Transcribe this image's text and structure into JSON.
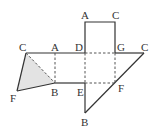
{
  "diagram": {
    "colors": {
      "line": "#333333",
      "dashed": "#555555",
      "shade": "#e3e3e3"
    },
    "labels": {
      "top_a": "A",
      "top_c": "C",
      "left_c": "C",
      "mid_a": "A",
      "d": "D",
      "g": "G",
      "right_c": "C",
      "left_f": "F",
      "left_b": "B",
      "e": "E",
      "right_f": "F",
      "bottom_b": "B"
    }
  }
}
